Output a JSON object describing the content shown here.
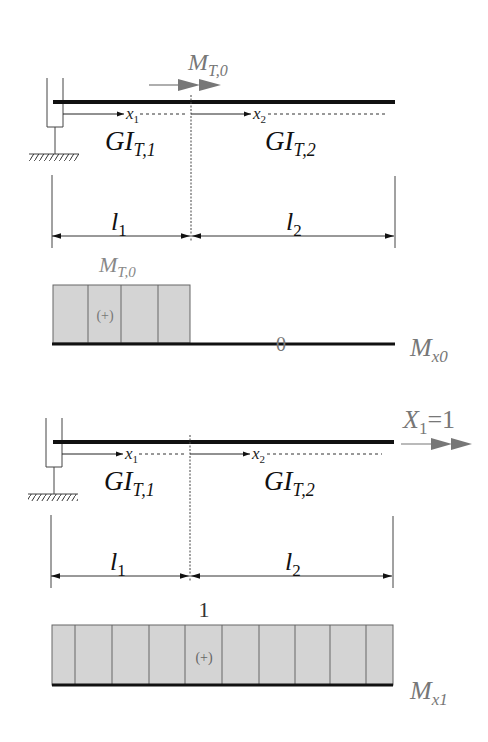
{
  "colors": {
    "beam": "#111111",
    "line": "#333333",
    "moment_fill": "#d4d4d4",
    "moment_stroke": "#555555",
    "gray_label": "#777777",
    "gray_arrow": "#777777"
  },
  "diagram_top": {
    "load_label_main": "M",
    "load_label_sub": "T,0",
    "segment1": {
      "coord_main": "x",
      "coord_sub": "1",
      "stiffness_main": "GI",
      "stiffness_sub": "T,1"
    },
    "segment2": {
      "coord_main": "x",
      "coord_sub": "2",
      "stiffness_main": "GI",
      "stiffness_sub": "T,2"
    },
    "dim1": {
      "main": "l",
      "sub": "1"
    },
    "dim2": {
      "main": "l",
      "sub": "2"
    },
    "moment": {
      "value_label_main": "M",
      "value_label_sub": "T,0",
      "sign": "(+)",
      "zero_label": "0",
      "name_main": "M",
      "name_sub": "x0"
    }
  },
  "diagram_bottom": {
    "load_label_main": "X",
    "load_label_sub": "1",
    "load_label_value": "=1",
    "segment1": {
      "coord_main": "x",
      "coord_sub": "1",
      "stiffness_main": "GI",
      "stiffness_sub": "T,1"
    },
    "segment2": {
      "coord_main": "x",
      "coord_sub": "2",
      "stiffness_main": "GI",
      "stiffness_sub": "T,2"
    },
    "dim1": {
      "main": "l",
      "sub": "1"
    },
    "dim2": {
      "main": "l",
      "sub": "2"
    },
    "moment": {
      "value_label": "1",
      "sign": "(+)",
      "name_main": "M",
      "name_sub": "x1"
    }
  }
}
